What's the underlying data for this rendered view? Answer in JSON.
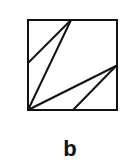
{
  "figure": {
    "label": "b",
    "stroke_color": "#111111",
    "square": {
      "x": 28,
      "y": 20,
      "width": 89,
      "height": 90
    },
    "lines": [
      {
        "x1": 28,
        "y1": 63,
        "x2": 71,
        "y2": 20
      },
      {
        "x1": 28,
        "y1": 110,
        "x2": 71,
        "y2": 20
      },
      {
        "x1": 28,
        "y1": 110,
        "x2": 116,
        "y2": 66
      },
      {
        "x1": 73,
        "y1": 110,
        "x2": 116,
        "y2": 66
      }
    ]
  }
}
